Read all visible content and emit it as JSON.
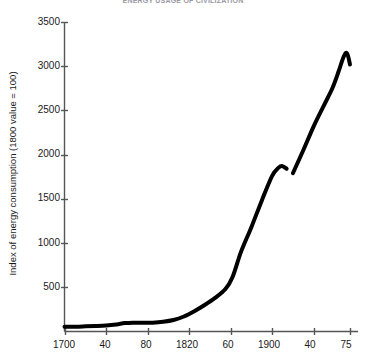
{
  "chart_data": {
    "type": "line",
    "title": "ENERGY USAGE OF CIVILIZATION",
    "xlabel": "",
    "ylabel": "Index of energy consumption (1800 value = 100)",
    "xlim": [
      1700,
      1975
    ],
    "ylim": [
      0,
      3500
    ],
    "grid": false,
    "legend": null,
    "x_tick_values": [
      1700,
      1740,
      1780,
      1820,
      1860,
      1900,
      1940,
      1975
    ],
    "x_tick_labels": [
      "1700",
      "40",
      "80",
      "1820",
      "60",
      "1900",
      "40",
      "75"
    ],
    "y_tick_values": [
      500,
      1000,
      1500,
      2000,
      2500,
      3000,
      3500
    ],
    "y_tick_labels": [
      "500",
      "1000",
      "1500",
      "2000",
      "2500",
      "3000",
      "3500"
    ],
    "line_color": "#000000",
    "line_width": 4,
    "note": "Line is broken (discontinuity) between 1914 and 1920",
    "series": [
      {
        "name": "Index of energy consumption",
        "segment": "1700-1914",
        "x": [
          1700,
          1710,
          1720,
          1730,
          1740,
          1750,
          1758,
          1766,
          1775,
          1785,
          1795,
          1805,
          1815,
          1825,
          1835,
          1845,
          1855,
          1862,
          1870,
          1880,
          1890,
          1900,
          1906,
          1910,
          1914
        ],
        "y": [
          55,
          55,
          58,
          62,
          68,
          80,
          95,
          100,
          98,
          100,
          110,
          130,
          170,
          230,
          300,
          380,
          480,
          620,
          900,
          1180,
          1480,
          1760,
          1850,
          1870,
          1840
        ]
      },
      {
        "name": "Index of energy consumption",
        "segment": "1920-1975",
        "x": [
          1920,
          1930,
          1940,
          1950,
          1958,
          1964,
          1968,
          1971,
          1973,
          1975
        ],
        "y": [
          1790,
          2050,
          2320,
          2560,
          2750,
          2940,
          3080,
          3150,
          3120,
          3020
        ]
      }
    ]
  }
}
